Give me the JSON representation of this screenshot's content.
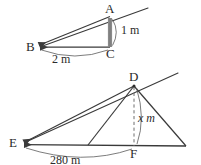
{
  "figure": {
    "stroke_color": "#3a3a3a",
    "bar_color": "#8a8a8a",
    "text_color": "#2b2b2b",
    "background": "#ffffff",
    "top_diagram": {
      "name": "small-triangle-abc",
      "vertices": [
        {
          "key": "A",
          "label": "A",
          "x": 110,
          "y": 16
        },
        {
          "key": "B",
          "label": "B",
          "x": 38,
          "y": 47
        },
        {
          "key": "C",
          "label": "C",
          "x": 110,
          "y": 47
        }
      ],
      "vertical_bar": {
        "label": "AC",
        "x": 110,
        "y_top": 18,
        "y_bottom": 47
      },
      "dimensions": [
        {
          "key": "height",
          "label": "1 m",
          "x": 118,
          "y": 26
        },
        {
          "key": "base",
          "label": "2 m",
          "x": 58,
          "y": 53
        }
      ],
      "ray": {
        "label": "ray-through-B-A-extended",
        "x1": 38,
        "y1": 47,
        "x2": 148,
        "y2": 8
      }
    },
    "bottom_diagram": {
      "name": "large-triangle-edf",
      "vertices": [
        {
          "key": "D",
          "label": "D",
          "x": 134,
          "y": 85
        },
        {
          "key": "E",
          "label": "E",
          "x": 22,
          "y": 143
        },
        {
          "key": "F",
          "label": "F",
          "x": 134,
          "y": 146
        },
        {
          "key": "G",
          "label": "",
          "x": 186,
          "y": 146
        },
        {
          "key": "H",
          "label": "",
          "x": 88,
          "y": 145
        }
      ],
      "dimensions": [
        {
          "key": "height",
          "label": "x m",
          "x": 117,
          "y": 118,
          "italic_first": true
        },
        {
          "key": "base",
          "label": "280 m",
          "x": 53,
          "y": 155
        }
      ],
      "ray": {
        "label": "ray-through-E-D-extended",
        "x1": 22,
        "y1": 143,
        "x2": 178,
        "y2": 73
      },
      "dashed_altitude": {
        "label": "altitude-D-to-F",
        "x": 134,
        "y_top": 85,
        "y_bottom": 146
      }
    }
  }
}
